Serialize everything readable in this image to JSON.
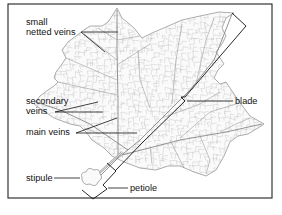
{
  "diagram": {
    "labels": {
      "small_netted_veins_line1": "small",
      "small_netted_veins_line2": "netted veins",
      "secondary_veins_line1": "secondary",
      "secondary_veins_line2": "veins",
      "main_veins": "main veins",
      "blade": "blade",
      "stipule": "stipule",
      "petiole": "petiole"
    },
    "colors": {
      "frame": "#222222",
      "leaf_outline": "#8a8a8a",
      "veins": "#b5b5b5",
      "text": "#111111"
    }
  }
}
